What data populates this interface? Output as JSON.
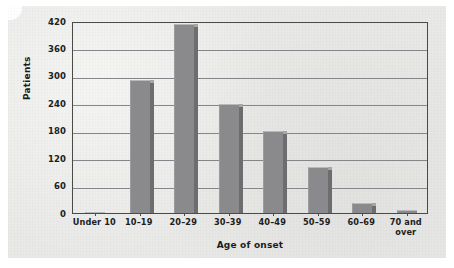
{
  "chart_data": {
    "type": "bar",
    "title": "",
    "subtitle": "",
    "xlabel": "Age of onset",
    "ylabel": "Patients",
    "categories": [
      "Under 10",
      "10–19",
      "20–29",
      "30–39",
      "40–49",
      "50–59",
      "60–69",
      "70 and over"
    ],
    "values": [
      2,
      292,
      414,
      238,
      180,
      100,
      22,
      6
    ],
    "ylim": [
      0,
      420
    ],
    "ytick_labels": [
      "0",
      "60",
      "120",
      "180",
      "240",
      "300",
      "360",
      "420"
    ],
    "ytick_values": [
      0,
      60,
      120,
      180,
      240,
      300,
      360,
      420
    ],
    "grid": "horizontal",
    "legend": "none",
    "bar_color": "#8a8a8c",
    "bar_shadow_color": "#6d6d6f",
    "gridline_color": "#86868a",
    "axis_color": "#4a4a48",
    "plot_background": "#e9e9e7",
    "text_color": "#1d1d1b"
  },
  "figure": {
    "background": "#ffffff",
    "panel_background": "#e9e9e7"
  }
}
